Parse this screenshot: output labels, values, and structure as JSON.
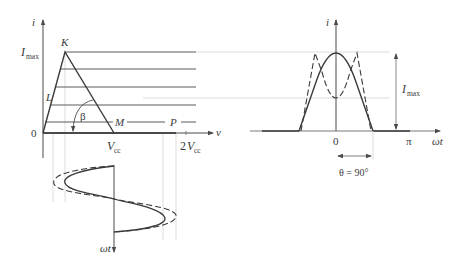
{
  "left_diagram": {
    "y_axis_label": "i",
    "x_axis_label": "v",
    "y_tick_imax": "I",
    "y_tick_imax_sub": "max",
    "origin_label": "0",
    "point_k": "K",
    "point_l": "L",
    "point_m": "M",
    "point_p": "P",
    "angle_label": "β",
    "x_tick_vcc": "V",
    "x_tick_vcc_sub": "cc",
    "x_tick_2vcc_coef": "2",
    "x_tick_2vcc": "V",
    "x_tick_2vcc_sub": "cc",
    "time_axis_label": "ωt"
  },
  "right_diagram": {
    "y_axis_label": "i",
    "x_axis_label": "ωt",
    "origin_label": "0",
    "x_tick_pi": "π",
    "imax_label": "I",
    "imax_sub": "max",
    "conduction_angle_label": "θ = 90°"
  },
  "colors": {
    "line": "#3c3c3c",
    "guide": "#c8c8c8"
  }
}
